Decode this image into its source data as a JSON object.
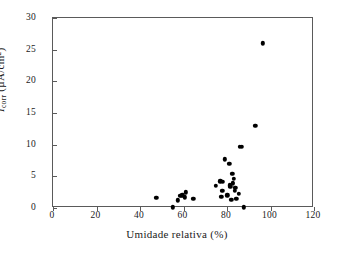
{
  "chart_data": {
    "type": "scatter",
    "title": "",
    "xlabel": "Umidade relativa (%)",
    "ylabel_parts": {
      "symbol": "I",
      "subscript": "corr",
      "units": " (µA/cm",
      "unit_sup": "2",
      "close": ")"
    },
    "ylabel": "Icorr (µA/cm2)",
    "xlim": [
      0,
      120
    ],
    "ylim": [
      0,
      30
    ],
    "xticks": [
      0,
      20,
      40,
      60,
      80,
      100,
      120
    ],
    "yticks": [
      0,
      5,
      10,
      15,
      20,
      25,
      30
    ],
    "grid": false,
    "legend": null,
    "marker": {
      "shape": "circle",
      "color": "#000000",
      "size": 4.4
    },
    "points": [
      {
        "x": 47.5,
        "y": 1.6
      },
      {
        "x": 55.0,
        "y": 0.1
      },
      {
        "x": 57.5,
        "y": 1.2
      },
      {
        "x": 58.5,
        "y": 1.9
      },
      {
        "x": 59.5,
        "y": 2.0
      },
      {
        "x": 60.5,
        "y": 1.7
      },
      {
        "x": 61.0,
        "y": 2.5
      },
      {
        "x": 64.5,
        "y": 1.5
      },
      {
        "x": 74.8,
        "y": 3.5
      },
      {
        "x": 77.0,
        "y": 4.2
      },
      {
        "x": 77.3,
        "y": 1.8
      },
      {
        "x": 77.8,
        "y": 2.7
      },
      {
        "x": 78.2,
        "y": 4.1
      },
      {
        "x": 79.0,
        "y": 7.7
      },
      {
        "x": 80.2,
        "y": 2.0
      },
      {
        "x": 81.0,
        "y": 7.0
      },
      {
        "x": 81.3,
        "y": 3.6
      },
      {
        "x": 81.6,
        "y": 3.3
      },
      {
        "x": 82.0,
        "y": 1.3
      },
      {
        "x": 82.4,
        "y": 5.4
      },
      {
        "x": 82.6,
        "y": 4.0
      },
      {
        "x": 82.8,
        "y": 3.8
      },
      {
        "x": 83.2,
        "y": 4.6
      },
      {
        "x": 83.5,
        "y": 2.7
      },
      {
        "x": 83.8,
        "y": 3.2
      },
      {
        "x": 84.3,
        "y": 1.5
      },
      {
        "x": 85.5,
        "y": 2.2
      },
      {
        "x": 85.8,
        "y": 9.7
      },
      {
        "x": 86.8,
        "y": 9.7
      },
      {
        "x": 87.8,
        "y": 0.1
      },
      {
        "x": 93.0,
        "y": 13.0
      },
      {
        "x": 96.5,
        "y": 26.0
      }
    ]
  }
}
